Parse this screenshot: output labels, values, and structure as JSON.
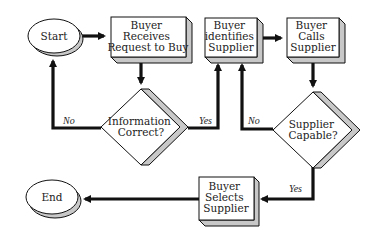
{
  "diagram": {
    "type": "flowchart",
    "colors": {
      "stroke": "#111111",
      "fill": "#ffffff",
      "shadow": "#c8c8c8"
    },
    "nodes": {
      "start": {
        "shape": "ellipse",
        "label": "Start"
      },
      "receives": {
        "shape": "process",
        "lines": [
          "Buyer",
          "Receives",
          "Request to Buy"
        ]
      },
      "info_correct": {
        "shape": "decision",
        "lines": [
          "Information",
          "Correct?"
        ]
      },
      "identifies": {
        "shape": "process",
        "lines": [
          "Buyer",
          "identifies",
          "Supplier"
        ]
      },
      "calls": {
        "shape": "process",
        "lines": [
          "Buyer",
          "Calls",
          "Supplier"
        ]
      },
      "capable": {
        "shape": "decision",
        "lines": [
          "Supplier",
          "Capable?"
        ]
      },
      "selects": {
        "shape": "process",
        "lines": [
          "Buyer",
          "Selects",
          "Supplier"
        ]
      },
      "end": {
        "shape": "ellipse",
        "label": "End"
      }
    },
    "edges": {
      "start_to_receives": {
        "from": "Start",
        "to": "Buyer Receives Request to Buy",
        "label": ""
      },
      "receives_to_info": {
        "from": "Buyer Receives Request to Buy",
        "to": "Information Correct?",
        "label": ""
      },
      "info_no": {
        "from": "Information Correct?",
        "to": "Start",
        "label": "No"
      },
      "info_yes": {
        "from": "Information Correct?",
        "to": "Buyer identifies Supplier",
        "label": "Yes"
      },
      "identifies_to_calls": {
        "from": "Buyer identifies Supplier",
        "to": "Buyer Calls Supplier",
        "label": ""
      },
      "calls_to_capable": {
        "from": "Buyer Calls Supplier",
        "to": "Supplier Capable?",
        "label": ""
      },
      "capable_no": {
        "from": "Supplier Capable?",
        "to": "Buyer identifies Supplier",
        "label": "No"
      },
      "capable_yes": {
        "from": "Supplier Capable?",
        "to": "Buyer Selects Supplier",
        "label": "Yes"
      },
      "selects_to_end": {
        "from": "Buyer Selects Supplier",
        "to": "End",
        "label": ""
      }
    }
  }
}
